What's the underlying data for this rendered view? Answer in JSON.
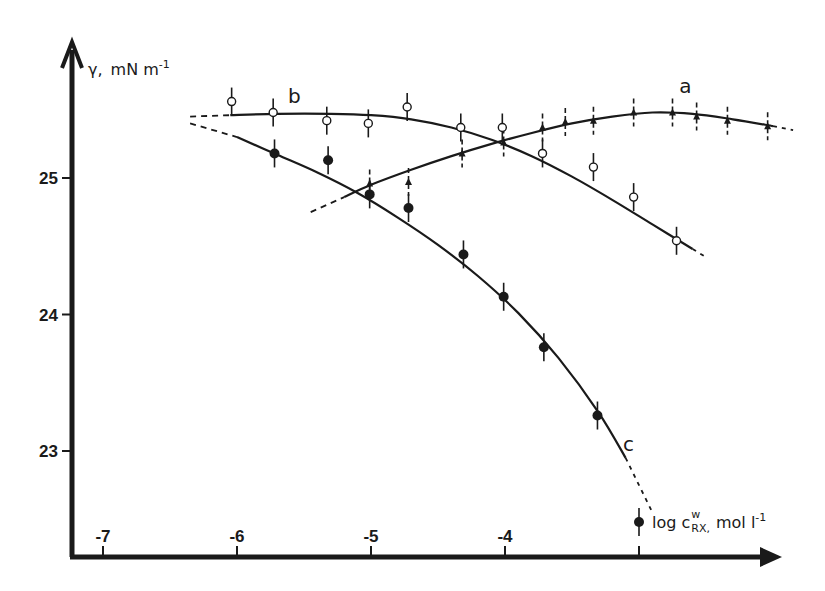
{
  "chart_data": {
    "type": "line",
    "title": "",
    "xlabel": "log c_RX^w, mol l^-1",
    "ylabel": "γ, mN m^-1",
    "xlabel_parts": {
      "prefix": "log c",
      "sup": "w",
      "sub": "RX",
      "suffix": ", mol l",
      "unit_exp": "-1"
    },
    "ylabel_parts": {
      "symbol": "γ,",
      "unit": "mN m",
      "unit_exp": "-1"
    },
    "xlim": [
      -7.25,
      -1.75
    ],
    "ylim": [
      22.2,
      25.9
    ],
    "grid": false,
    "legend": "inline curve labels a, b, c",
    "x_ticks": [
      -7,
      -6,
      -5,
      -4,
      -3
    ],
    "x_tick_labels": [
      "-7",
      "-6",
      "-5",
      "-4",
      ""
    ],
    "y_ticks": [
      25,
      24,
      23
    ],
    "y_tick_labels": [
      "25",
      "24",
      "23"
    ],
    "series": [
      {
        "name": "a",
        "marker": "triangle",
        "x": [
          -5.01,
          -4.72,
          -4.32,
          -4.01,
          -3.72,
          -3.55,
          -3.34,
          -3.04,
          -2.75,
          -2.57,
          -2.34,
          -2.04
        ],
        "y": [
          24.96,
          24.97,
          25.18,
          25.26,
          25.37,
          25.41,
          25.42,
          25.48,
          25.48,
          25.45,
          25.42,
          25.38
        ],
        "fit_x": [
          -5.45,
          -5.2,
          -5.0,
          -4.7,
          -4.4,
          -4.1,
          -3.8,
          -3.5,
          -3.2,
          -2.9,
          -2.6,
          -2.3,
          -2.0,
          -1.85
        ],
        "fit_y": [
          24.75,
          24.86,
          24.95,
          25.06,
          25.16,
          25.25,
          25.33,
          25.4,
          25.45,
          25.48,
          25.47,
          25.43,
          25.38,
          25.35
        ],
        "dashed_ends": true,
        "label_pos": [
          -2.7,
          25.62
        ]
      },
      {
        "name": "b",
        "marker": "open-circle",
        "x": [
          -6.04,
          -5.73,
          -5.33,
          -5.02,
          -4.73,
          -4.33,
          -4.02,
          -3.72,
          -3.34,
          -3.04,
          -2.72
        ],
        "y": [
          25.56,
          25.48,
          25.42,
          25.4,
          25.52,
          25.37,
          25.37,
          25.18,
          25.08,
          24.86,
          24.54
        ],
        "fit_x": [
          -6.35,
          -6.05,
          -5.7,
          -5.3,
          -5.0,
          -4.7,
          -4.4,
          -4.1,
          -3.8,
          -3.5,
          -3.2,
          -2.9,
          -2.6,
          -2.5
        ],
        "fit_y": [
          25.45,
          25.46,
          25.47,
          25.47,
          25.46,
          25.43,
          25.37,
          25.28,
          25.16,
          25.01,
          24.84,
          24.66,
          24.48,
          24.42
        ],
        "dashed_ends": true,
        "label_pos": [
          -5.62,
          25.55
        ]
      },
      {
        "name": "c",
        "marker": "filled-circle",
        "x": [
          -5.72,
          -5.32,
          -5.01,
          -4.72,
          -4.31,
          -4.01,
          -3.71,
          -3.31,
          -3.0
        ],
        "y": [
          25.18,
          25.13,
          24.88,
          24.78,
          24.44,
          24.13,
          23.76,
          23.26,
          22.48
        ],
        "fit_x": [
          -6.35,
          -6.0,
          -5.7,
          -5.4,
          -5.1,
          -4.8,
          -4.5,
          -4.2,
          -3.9,
          -3.6,
          -3.3,
          -3.1,
          -2.9
        ],
        "fit_y": [
          25.4,
          25.3,
          25.17,
          25.04,
          24.89,
          24.71,
          24.51,
          24.28,
          24.01,
          23.68,
          23.28,
          22.95,
          22.55
        ],
        "dashed_ends": true,
        "label_pos": [
          -3.12,
          23.0
        ]
      }
    ]
  },
  "axes": {
    "y_title_symbol": "γ,",
    "y_title_unit": "mN m",
    "y_title_exp": "-1",
    "x_title_prefix": "log c",
    "x_title_sup": "w",
    "x_title_sub": "RX,",
    "x_title_suffix": "mol l",
    "x_title_exp": "-1"
  }
}
